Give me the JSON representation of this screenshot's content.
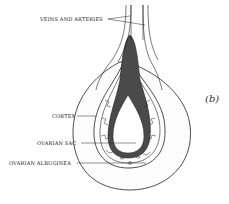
{
  "figure": {
    "panel_label": "(b)",
    "labels": {
      "veins": "VEINS AND ARTERIES",
      "cortex": "CORTEX",
      "sac": "OVARIAN SAC",
      "albuginea": "OVARIAN ALBUGINEA"
    },
    "colors": {
      "line": "#222222",
      "dark_fill": "#4a4a4a",
      "stipple": "#bbbbbb",
      "background": "#ffffff"
    }
  }
}
